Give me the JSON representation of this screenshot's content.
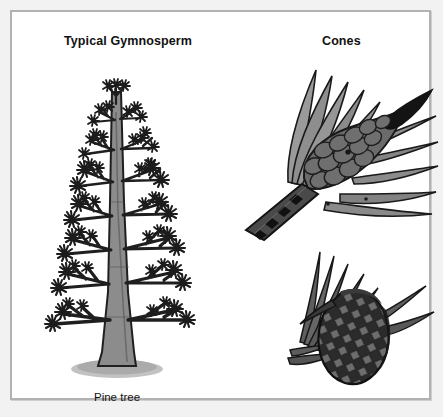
{
  "figure": {
    "background_color": "#f2f2f2",
    "plate_background": "#ffffff",
    "border_color": "#b2b2b2"
  },
  "headings": {
    "left": "Typical Gymnosperm",
    "right": "Cones"
  },
  "captions": {
    "tree": "Pine tree"
  },
  "illustrations": [
    {
      "name": "pine-tree",
      "label": "Pine tree",
      "description": "Full conifer tree with tiered horizontal branches, needle tufts, tapering gray trunk and elliptical ground shadow",
      "colors": {
        "foliage": "#1c1c1c",
        "trunk": "#8c8c8c",
        "trunk_outline": "#1c1c1c",
        "ground": "#b9b9b9"
      }
    },
    {
      "name": "young-cone-with-needles",
      "label": "Cones",
      "description": "Immature pine cone on a branch tip surrounded by long pine needles, dark pointed apex, gray overlapping scales",
      "colors": {
        "needles": "#8f8f8f",
        "needle_outline": "#1c1c1c",
        "cone_scales": "#6a6a6a",
        "cone_tip": "#141414",
        "stem": "#4a4a4a"
      }
    },
    {
      "name": "mature-pine-cone",
      "label": "Cones",
      "description": "Mature woody pine cone with diamond-patterned scales and needles fanning to the upper left",
      "colors": {
        "cone_body": "#2b2b2b",
        "scales": "#6f6f6f",
        "needles": "#5a5a5a",
        "needle_outline": "#171717"
      }
    }
  ]
}
